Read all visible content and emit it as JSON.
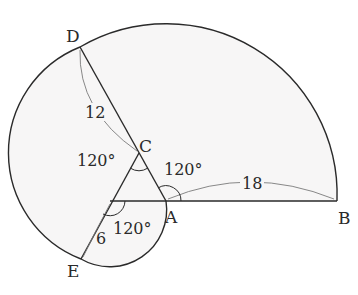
{
  "figure": {
    "type": "geometry-diagram",
    "points": {
      "A": "A",
      "B": "B",
      "C": "C",
      "D": "D",
      "E": "E"
    },
    "lengths": {
      "AB": "18",
      "CD": "12",
      "E_side": "6"
    },
    "angles": {
      "at_C": "120°",
      "at_A": "120°",
      "at_bottom_vertex": "120°"
    },
    "colors": {
      "stroke": "#2a2a2a",
      "fill": "#f7f6f6",
      "dimension_line": "#7a7a7a",
      "background": "#ffffff"
    }
  }
}
